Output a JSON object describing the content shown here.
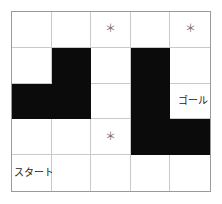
{
  "figure": {
    "grid": {
      "rows": 5,
      "columns": 5,
      "wall_color": "#0b0b0b",
      "path_color": "#ffffff",
      "border_color": "#9a9a9a",
      "gridline_color": "#c9c9c9"
    }
  },
  "labels": {
    "start": "スタート",
    "goal": "ゴール",
    "star": "＊"
  },
  "cells": [
    [
      {
        "type": "path",
        "marker": "",
        "label": ""
      },
      {
        "type": "path",
        "marker": "",
        "label": ""
      },
      {
        "type": "path",
        "marker": "＊",
        "label": ""
      },
      {
        "type": "path",
        "marker": "",
        "label": ""
      },
      {
        "type": "path",
        "marker": "＊",
        "label": ""
      }
    ],
    [
      {
        "type": "path",
        "marker": "",
        "label": ""
      },
      {
        "type": "wall",
        "marker": "",
        "label": ""
      },
      {
        "type": "path",
        "marker": "",
        "label": ""
      },
      {
        "type": "wall",
        "marker": "",
        "label": ""
      },
      {
        "type": "path",
        "marker": "",
        "label": ""
      }
    ],
    [
      {
        "type": "wall",
        "marker": "",
        "label": ""
      },
      {
        "type": "wall",
        "marker": "",
        "label": ""
      },
      {
        "type": "path",
        "marker": "",
        "label": ""
      },
      {
        "type": "wall",
        "marker": "",
        "label": ""
      },
      {
        "type": "path",
        "marker": "",
        "label": "ゴール"
      }
    ],
    [
      {
        "type": "path",
        "marker": "",
        "label": ""
      },
      {
        "type": "path",
        "marker": "",
        "label": ""
      },
      {
        "type": "path",
        "marker": "＊",
        "label": ""
      },
      {
        "type": "wall",
        "marker": "",
        "label": ""
      },
      {
        "type": "wall",
        "marker": "",
        "label": ""
      }
    ],
    [
      {
        "type": "path",
        "marker": "",
        "label": "スタート"
      },
      {
        "type": "path",
        "marker": "",
        "label": ""
      },
      {
        "type": "path",
        "marker": "",
        "label": ""
      },
      {
        "type": "path",
        "marker": "",
        "label": ""
      },
      {
        "type": "path",
        "marker": "",
        "label": ""
      }
    ]
  ]
}
